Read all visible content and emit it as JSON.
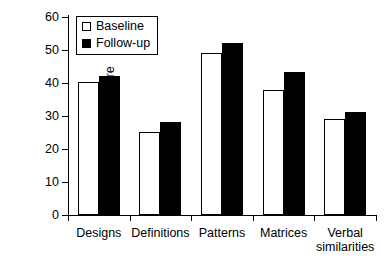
{
  "chart_data": {
    "type": "bar",
    "title": "",
    "xlabel": "",
    "ylabel": "BAS ability score",
    "ylim": [
      0,
      60
    ],
    "yticks": [
      0,
      10,
      20,
      30,
      40,
      50,
      60
    ],
    "ytick_labels": [
      "0",
      "10",
      "20",
      "30",
      "40",
      "50",
      "60"
    ],
    "grid": false,
    "legend_position": "top-left",
    "categories": [
      "Designs",
      "Definitions",
      "Patterns",
      "Matrices",
      "Verbal\nsimilarities"
    ],
    "series": [
      {
        "name": "Baseline",
        "style": "open-square",
        "fill": "#ffffff",
        "edge": "#000000",
        "values": [
          40.2,
          25.2,
          49.1,
          38.0,
          29.0
        ]
      },
      {
        "name": "Follow-up",
        "style": "filled-square",
        "fill": "#000000",
        "edge": "#000000",
        "values": [
          42.1,
          28.3,
          52.1,
          43.3,
          31.3
        ]
      }
    ]
  },
  "legend": {
    "items": [
      {
        "label": "Baseline",
        "swatch": "open-square-icon"
      },
      {
        "label": "Follow-up",
        "swatch": "filled-square-icon"
      }
    ]
  },
  "axes": {
    "y_title": "BAS ability score"
  },
  "colors": {
    "baseline": "#ffffff",
    "followup": "#000000",
    "axis": "#000000",
    "background": "#ffffff"
  }
}
